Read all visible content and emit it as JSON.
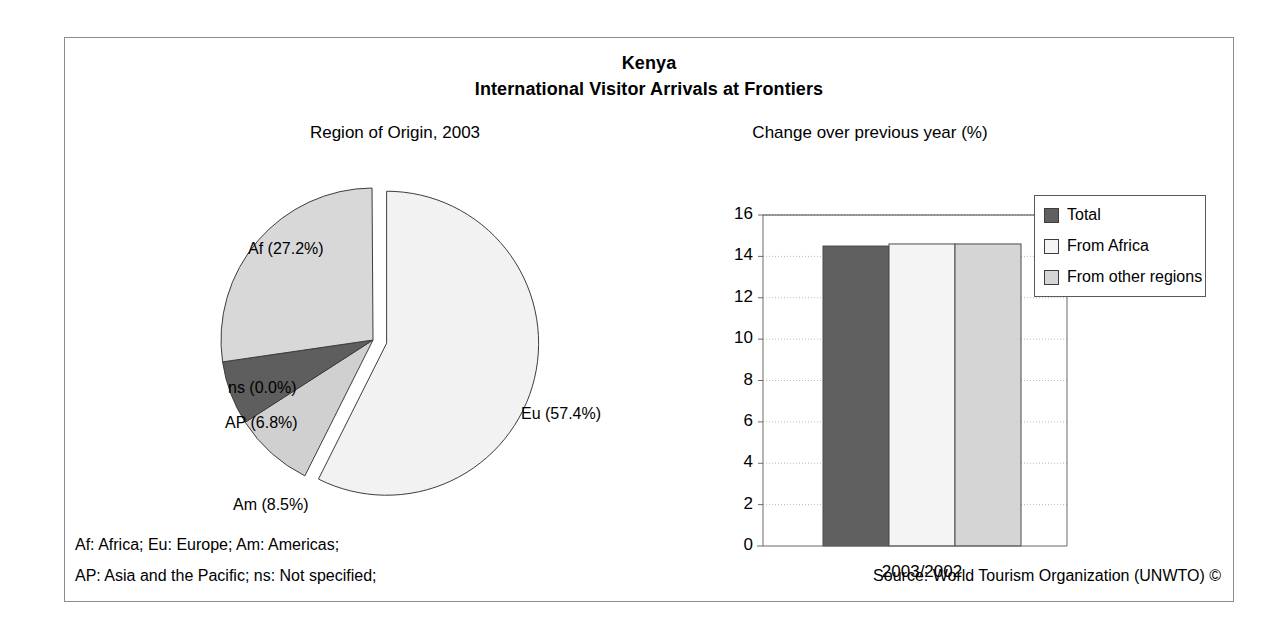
{
  "header": {
    "country": "Kenya",
    "subtitle": "International Visitor Arrivals at Frontiers"
  },
  "pie_panel": {
    "caption": "Region of Origin, 2003"
  },
  "bar_panel": {
    "caption": "Change over previous year (%)"
  },
  "footnotes": {
    "line1": "Af: Africa; Eu: Europe; Am: Americas;",
    "line2": "AP: Asia and the Pacific; ns: Not specified;",
    "source": "Source: World Tourism Organization (UNWTO) ©"
  },
  "colors": {
    "outline": "#3d3d3d",
    "frame": "#8c8c8c",
    "slice_eu": "#f2f2f2",
    "slice_af": "#d8d8d8",
    "slice_am": "#d0d0d0",
    "slice_ap": "#5e5e5e",
    "slice_ns": "#9a9a9a",
    "bar_total": "#606060",
    "bar_africa": "#f4f4f4",
    "bar_other": "#d5d5d5",
    "gridline": "#b9b9b9"
  },
  "chart_data": [
    {
      "type": "pie",
      "title": "Region of Origin, 2003",
      "labels": [
        "Eu",
        "Am",
        "AP",
        "ns",
        "Af"
      ],
      "label_texts": [
        "Eu (57.4%)",
        "Am (8.5%)",
        "AP (6.8%)",
        "ns (0.0%)",
        "Af (27.2%)"
      ],
      "values": [
        57.4,
        8.5,
        6.8,
        0.0,
        27.2
      ],
      "units": "%",
      "exploded": [
        "Eu"
      ],
      "start_angle_deg": 0,
      "direction": "clockwise",
      "legend": "none",
      "label_keys": {
        "Af": "Africa",
        "Eu": "Europe",
        "Am": "Americas",
        "AP": "Asia and the Pacific",
        "ns": "Not specified"
      }
    },
    {
      "type": "bar",
      "title": "Change over previous year (%)",
      "xlabel": "",
      "ylabel": "",
      "categories": [
        "2003/2002"
      ],
      "series": [
        {
          "name": "Total",
          "values": [
            14.5
          ]
        },
        {
          "name": "From Africa",
          "values": [
            14.6
          ]
        },
        {
          "name": "From other regions",
          "values": [
            14.6
          ]
        }
      ],
      "ylim": [
        0,
        16
      ],
      "yticks": [
        0,
        2,
        4,
        6,
        8,
        10,
        12,
        14,
        16
      ],
      "ytick_labels": [
        "0",
        "2",
        "4",
        "6",
        "8",
        "10",
        "12",
        "14",
        "16"
      ],
      "grid": true,
      "legend_position": "right",
      "legend_entries": [
        "Total",
        "From Africa",
        "From other regions"
      ]
    }
  ]
}
